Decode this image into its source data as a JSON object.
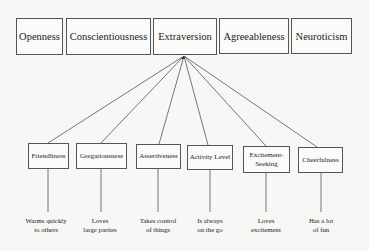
{
  "diagram": {
    "domains": [
      {
        "label": "Openness"
      },
      {
        "label": "Conscientiousness"
      },
      {
        "label": "Extraversion"
      },
      {
        "label": "Agreeableness"
      },
      {
        "label": "Neuroticism"
      }
    ],
    "expanded_domain": "Extraversion",
    "facets": [
      {
        "label": "Friendliness",
        "example": [
          "Warms quickly",
          "to others"
        ]
      },
      {
        "label": "Gregariousness",
        "example": [
          "Loves",
          "large parties"
        ]
      },
      {
        "label": "Assertiveness",
        "example": [
          "Takes control",
          "of things"
        ]
      },
      {
        "label": "Activity Level",
        "example": [
          "Is always",
          "on the go"
        ]
      },
      {
        "label": "Excitement-Seeking",
        "example": [
          "Loves",
          "excitement"
        ]
      },
      {
        "label": "Cheerfulness",
        "example": [
          "Has a lot",
          "of fun"
        ]
      }
    ]
  },
  "colors": {
    "line": "#555555",
    "background": "#f7f7f5"
  }
}
